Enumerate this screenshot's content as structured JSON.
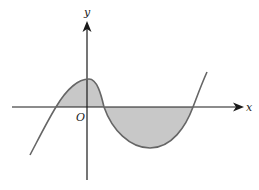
{
  "diagram": {
    "type": "cubic-graph-shaded-area",
    "labels": {
      "y_axis": "y",
      "x_axis": "x",
      "origin": "O"
    },
    "colors": {
      "axis": "#1a1a1a",
      "curve": "#666666",
      "shade": "#c8c8c8",
      "label": "#222222"
    },
    "curve_features": {
      "roots": [
        "left of O",
        "right of O",
        "far right"
      ],
      "local_max": "just right of y-axis, above x-axis",
      "local_min": "below x-axis between 2nd and 3rd roots",
      "shaded_regions": [
        "between 1st and 2nd roots (above x-axis)",
        "between 2nd and 3rd roots (below x-axis)"
      ]
    }
  }
}
